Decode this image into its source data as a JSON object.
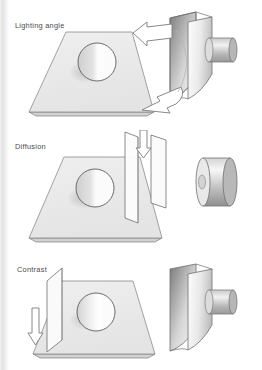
{
  "document": {
    "title": "Lighting setup diagram",
    "background_color": "#ffffff",
    "text_color": "#4a4a4a",
    "width": 262,
    "height": 370
  },
  "panels": [
    {
      "label": "Lighting angle",
      "icon": "lighting-angle-diagram",
      "description": "Isometric ground plane with sphere, softbox light at right, two curved outline arrows indicating light angle movement",
      "elements": {
        "plane": "isometric-ground-plane",
        "subject": "sphere",
        "light": "softbox-light",
        "arrow_upper": "curved-arrow-left",
        "arrow_lower": "curved-arrow-down-left"
      }
    },
    {
      "label": "Diffusion",
      "icon": "diffusion-diagram",
      "description": "Isometric ground plane with sphere, two translucent diffusion panels with downward arrow, bare cylindrical light head at right",
      "elements": {
        "plane": "isometric-ground-plane",
        "subject": "sphere",
        "diffuser_near": "diffusion-panel",
        "diffuser_far": "diffusion-panel",
        "arrow": "straight-arrow-down",
        "light": "cylinder-light-head"
      }
    },
    {
      "label": "Contrast",
      "icon": "contrast-diagram",
      "description": "Isometric ground plane with sphere, vertical reflector card at left with downward arrow, softbox light at right",
      "elements": {
        "plane": "isometric-ground-plane",
        "subject": "sphere",
        "reflector": "reflector-card",
        "arrow": "straight-arrow-down",
        "light": "softbox-light"
      }
    }
  ],
  "colors": {
    "plane_fill": "#ececec",
    "plane_edge": "#8c8c8c",
    "sphere_light": "#fdfdfd",
    "sphere_dark": "#d6d6d6",
    "light_body_light": "#f4f4f4",
    "light_body_dark": "#a8a8a8",
    "stroke": "#6e6e6e",
    "shadow": "#c9c9c9",
    "arrow_fill": "#ffffff",
    "label_text": "#4a4a4a"
  }
}
